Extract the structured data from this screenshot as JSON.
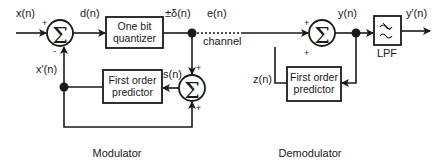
{
  "diagram": {
    "type": "block-diagram",
    "modulator": {
      "caption": "Modulator",
      "input_label": "x(n)",
      "diff_label": "d(n)",
      "quantizer_line1": "One bit",
      "quantizer_line2": "quantizer",
      "quantizer_out_label": "±δ(n)",
      "feedback_label": "x'(n)",
      "sum_out_label": "s(n)",
      "predictor_line1": "First order",
      "predictor_line2": "predictor",
      "sum1_plus": "+",
      "sum1_minus": "-",
      "sum2_top_sign": "+",
      "sum2_bottom_sign": "+",
      "sigma": "Σ"
    },
    "channel": {
      "signal_label": "e(n)",
      "label": "channel"
    },
    "demodulator": {
      "caption": "Demodulator",
      "sum_out_label": "y(n)",
      "feedback_label": "z(n)",
      "predictor_line1": "First order",
      "predictor_line2": "predictor",
      "filter_label": "LPF",
      "output_label": "y'(n)",
      "sum_top_sign": "+",
      "sum_bottom_sign": "+",
      "sigma": "Σ"
    },
    "colors": {
      "stroke": "#1a1a1a",
      "background": "#ffffff"
    }
  }
}
